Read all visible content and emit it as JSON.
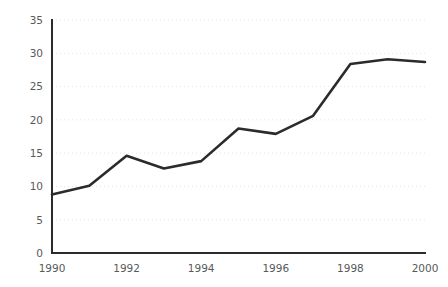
{
  "chart_data": {
    "type": "line",
    "title": "",
    "subtitle": "",
    "xlabel": "",
    "ylabel": "",
    "x": [
      1990,
      1991,
      1992,
      1993,
      1994,
      1995,
      1996,
      1997,
      1998,
      1999,
      2000
    ],
    "series": [
      {
        "name": "",
        "values": [
          8.8,
          10.1,
          14.6,
          12.7,
          13.8,
          18.7,
          17.9,
          20.6,
          28.4,
          29.1,
          28.7
        ]
      }
    ],
    "xlim": [
      1990,
      2000
    ],
    "ylim": [
      0,
      35
    ],
    "x_tick_labels": [
      "1990",
      "1992",
      "1994",
      "1996",
      "1998",
      "2000"
    ],
    "x_tick_values": [
      1990,
      1992,
      1994,
      1996,
      1998,
      2000
    ],
    "y_tick_labels": [
      "0",
      "5",
      "10",
      "15",
      "20",
      "25",
      "30",
      "35"
    ],
    "y_tick_values": [
      0,
      5,
      10,
      15,
      20,
      25,
      30,
      35
    ],
    "grid": true,
    "grid_axis": "y",
    "legend": false,
    "legend_position": "none",
    "annotations": [],
    "colors": {
      "line": "#2b2b2b",
      "grid": "#e6e6e6",
      "axis": "#2b2b2b",
      "tick_text": "#595959",
      "background": "#ffffff"
    }
  },
  "layout": {
    "plot_left": 52,
    "plot_right": 425,
    "plot_top": 20,
    "plot_bottom": 253
  }
}
